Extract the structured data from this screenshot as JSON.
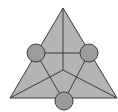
{
  "diagram": {
    "title": "",
    "colors": {
      "triangle_fill": "#b4b4b4",
      "circle_fill": "#9c9c9c",
      "stroke": "#3c3c3c",
      "background": "#ffffff"
    },
    "triangle": {
      "vertices": [
        [
          63,
          8
        ],
        [
          10,
          98
        ],
        [
          117,
          98
        ]
      ]
    },
    "center_point": [
      63,
      70
    ],
    "circles": [
      {
        "id": "left",
        "cx": 36,
        "cy": 53,
        "r": 9
      },
      {
        "id": "right",
        "cx": 89,
        "cy": 53,
        "r": 9
      },
      {
        "id": "bottom",
        "cx": 64,
        "cy": 101,
        "r": 9
      }
    ],
    "segments": [
      {
        "id": "apex-to-center",
        "from": [
          63,
          8
        ],
        "to": [
          63,
          70
        ]
      },
      {
        "id": "left-to-right-circle",
        "from": [
          36,
          53
        ],
        "to": [
          89,
          53
        ]
      },
      {
        "id": "bottomleft-to-center",
        "from": [
          10,
          98
        ],
        "to": [
          63,
          70
        ]
      },
      {
        "id": "bottomright-to-center",
        "from": [
          117,
          98
        ],
        "to": [
          63,
          70
        ]
      },
      {
        "id": "leftcircle-to-bottomcircle",
        "from": [
          36,
          53
        ],
        "to": [
          64,
          101
        ]
      },
      {
        "id": "rightcircle-to-bottomcircle",
        "from": [
          89,
          53
        ],
        "to": [
          64,
          101
        ]
      }
    ]
  }
}
